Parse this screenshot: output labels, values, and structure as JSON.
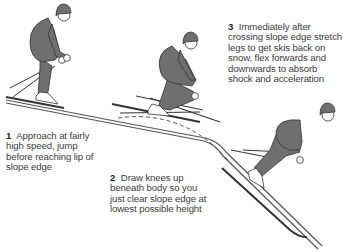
{
  "diagram": {
    "colors": {
      "figure": "#6f6f6f",
      "outline": "#2a2a2a",
      "slope": "#555555",
      "text": "#3c3c3c",
      "background": "#ffffff"
    },
    "steps": [
      {
        "number": "1",
        "text": "Approach at fairly high speed, jump before reaching lip of slope edge"
      },
      {
        "number": "2",
        "text": "Draw knees up beneath body so you just clear slope edge at lowest possible height"
      },
      {
        "number": "3",
        "text": "Immediately after crossing slope edge stretch legs to get skis back on snow, flex forwards and downwards to absorb shock and acceleration"
      }
    ],
    "elements": {
      "trajectory": "dashed-line",
      "terrain": "slope-edge-profile",
      "figures": [
        "skier-approach",
        "skier-airborne",
        "skier-landing"
      ]
    }
  }
}
